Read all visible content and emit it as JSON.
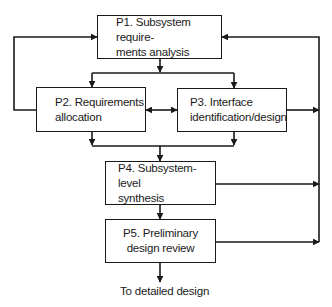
{
  "diagram": {
    "type": "process-flow",
    "nodes": {
      "p1": {
        "line1": "P1. Subsystem require-",
        "line2": "ments analysis"
      },
      "p2": {
        "line1": "P2. Requirements",
        "line2": "allocation"
      },
      "p3": {
        "line1": "P3. Interface",
        "line2": "identification/design"
      },
      "p4": {
        "line1": "P4. Subsystem-level",
        "line2": "synthesis"
      },
      "p5": {
        "line1": "P5. Preliminary",
        "line2": "design review"
      }
    },
    "output_label": "To detailed design",
    "edges": [
      {
        "from": "P1",
        "to": "P2"
      },
      {
        "from": "P1",
        "to": "P3"
      },
      {
        "from": "P2",
        "to": "P3",
        "bidirectional": true
      },
      {
        "from": "P2",
        "to": "P4"
      },
      {
        "from": "P3",
        "to": "P4"
      },
      {
        "from": "P4",
        "to": "P5"
      },
      {
        "from": "P5",
        "to": "To detailed design"
      },
      {
        "from": "P2",
        "to": "P1",
        "type": "feedback"
      },
      {
        "from": "P3",
        "to": "P1",
        "type": "feedback"
      },
      {
        "from": "P4",
        "to": "P1",
        "type": "feedback"
      },
      {
        "from": "P5",
        "to": "P1",
        "type": "feedback"
      }
    ]
  }
}
